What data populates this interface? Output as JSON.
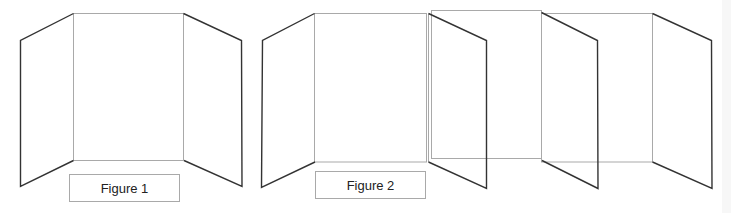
{
  "figures": [
    {
      "id": "figure-1",
      "caption": "Figure 1",
      "description": "Tri-fold display board (three panels)",
      "panels": 3
    },
    {
      "id": "figure-2",
      "caption": "Figure 2",
      "description": "Extended multi-panel folding display board",
      "panels": 6
    }
  ],
  "colors": {
    "background": "#ffffff",
    "panel_outline": "#a9a9a9",
    "flap_outline": "#333333",
    "caption_text": "#222222"
  }
}
